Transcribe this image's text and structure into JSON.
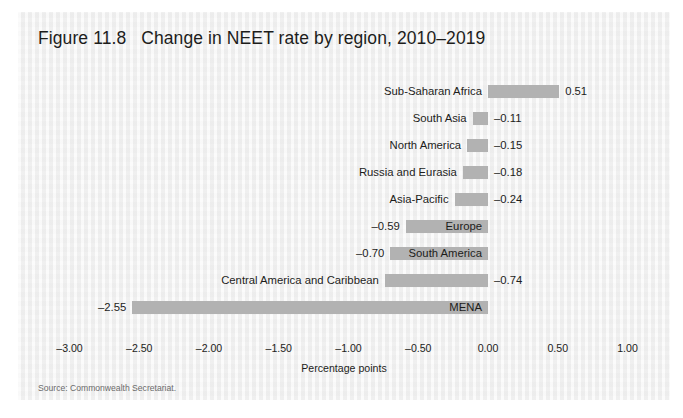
{
  "figure": {
    "title": "Figure 11.8   Change in NEET rate by region, 2010–2019",
    "source": "Source: Commonwealth Secretariat."
  },
  "chart_data": {
    "type": "bar",
    "orientation": "horizontal",
    "title": "Figure 11.8   Change in NEET rate by region, 2010–2019",
    "xlabel": "Percentage points",
    "ylabel": "",
    "xlim": [
      -3.0,
      1.0
    ],
    "grid": false,
    "legend": null,
    "bar_color": "#b2b2b2",
    "tick_labels": [
      "–3.00",
      "–2.50",
      "–2.00",
      "–1.50",
      "–1.00",
      "–0.50",
      "0.00",
      "0.50",
      "1.00"
    ],
    "tick_values": [
      -3.0,
      -2.5,
      -2.0,
      -1.5,
      -1.0,
      -0.5,
      0.0,
      0.5,
      1.0
    ],
    "categories": [
      "Sub-Saharan Africa",
      "South Asia",
      "North America",
      "Russia and Eurasia",
      "Asia-Pacific",
      "Europe",
      "South America",
      "Central America and Caribbean",
      "MENA"
    ],
    "values": [
      0.51,
      -0.11,
      -0.15,
      -0.18,
      -0.24,
      -0.59,
      -0.7,
      -0.74,
      -2.55
    ],
    "value_labels": [
      "0.51",
      "–0.11",
      "–0.15",
      "–0.18",
      "–0.24",
      "–0.59",
      "–0.70",
      "–0.74",
      "–2.55"
    ],
    "bars": [
      {
        "category": "Sub-Saharan Africa",
        "value": 0.51,
        "label": "0.51",
        "label_side": "right",
        "name_side": "left"
      },
      {
        "category": "South Asia",
        "value": -0.11,
        "label": "–0.11",
        "label_side": "right",
        "name_side": "left"
      },
      {
        "category": "North America",
        "value": -0.15,
        "label": "–0.15",
        "label_side": "right",
        "name_side": "left"
      },
      {
        "category": "Russia and Eurasia",
        "value": -0.18,
        "label": "–0.18",
        "label_side": "right",
        "name_side": "left"
      },
      {
        "category": "Asia-Pacific",
        "value": -0.24,
        "label": "–0.24",
        "label_side": "right",
        "name_side": "left"
      },
      {
        "category": "Europe",
        "value": -0.59,
        "label": "–0.59",
        "label_side": "left",
        "name_side": "overlay-right"
      },
      {
        "category": "South America",
        "value": -0.7,
        "label": "–0.70",
        "label_side": "left",
        "name_side": "overlay-right"
      },
      {
        "category": "Central America and Caribbean",
        "value": -0.74,
        "label": "–0.74",
        "label_side": "right",
        "name_side": "left"
      },
      {
        "category": "MENA",
        "value": -2.55,
        "label": "–2.55",
        "label_side": "left",
        "name_side": "overlay-right"
      }
    ]
  }
}
